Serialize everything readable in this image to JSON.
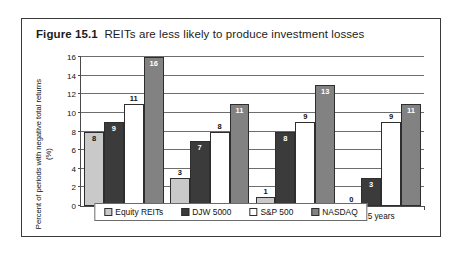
{
  "figure": {
    "number": "Figure 15.1",
    "caption": "REITs are less likely to produce investment losses"
  },
  "chart_data": {
    "type": "bar",
    "title": "REITs are less likely to produce investment losses",
    "xlabel": "",
    "ylabel": "Percent of periods with negative total returns (%)",
    "ylim": [
      0,
      16
    ],
    "ytick_step": 2,
    "yticks": [
      0,
      2,
      4,
      6,
      8,
      10,
      12,
      14,
      16
    ],
    "grid": true,
    "legend_position": "bottom",
    "categories": [
      "2 years",
      "3 years",
      "4 years",
      "5 years"
    ],
    "series": [
      {
        "name": "Equity REITs",
        "color": "#c9c9c9",
        "values": [
          8,
          3,
          1,
          0
        ]
      },
      {
        "name": "DJW 5000",
        "color": "#3b3b3b",
        "values": [
          9,
          7,
          8,
          3
        ]
      },
      {
        "name": "S&P 500",
        "color": "#ffffff",
        "values": [
          11,
          8,
          9,
          9
        ]
      },
      {
        "name": "NASDAQ",
        "color": "#828282",
        "values": [
          16,
          11,
          13,
          11
        ]
      }
    ]
  }
}
